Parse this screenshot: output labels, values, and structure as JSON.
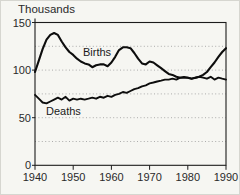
{
  "figure": {
    "y_axis_title": "Thousands",
    "births_label": "Births",
    "deaths_label": "Deaths"
  },
  "colors": {
    "line": "#0d0d0d",
    "frame": "#1c1c1c",
    "gridline": "#999999",
    "background": "#f6f6f2",
    "text": "#2a2a2a"
  },
  "chart_data": {
    "type": "line",
    "title": "",
    "xlabel": "",
    "ylabel": "Thousands",
    "xlim": [
      1940,
      1990
    ],
    "ylim": [
      0,
      150
    ],
    "x_ticks": [
      1940,
      1950,
      1960,
      1970,
      1980,
      1990
    ],
    "y_ticks": [
      0,
      50,
      100,
      150
    ],
    "gridlines": {
      "y_values": [
        25,
        50,
        75,
        100,
        125
      ],
      "style": "dotted"
    },
    "legend": "inline-annotations",
    "x": [
      1940,
      1941,
      1942,
      1943,
      1944,
      1945,
      1946,
      1947,
      1948,
      1949,
      1950,
      1951,
      1952,
      1953,
      1954,
      1955,
      1956,
      1957,
      1958,
      1959,
      1960,
      1961,
      1962,
      1963,
      1964,
      1965,
      1966,
      1967,
      1968,
      1969,
      1970,
      1971,
      1972,
      1973,
      1974,
      1975,
      1976,
      1977,
      1978,
      1979,
      1980,
      1981,
      1982,
      1983,
      1984,
      1985,
      1986,
      1987,
      1988,
      1989,
      1990
    ],
    "series": [
      {
        "name": "Births",
        "values": [
          98,
          110,
          122,
          132,
          137,
          139,
          137,
          130,
          124,
          119,
          116,
          112,
          109,
          107,
          106,
          103,
          105,
          106,
          106,
          104,
          108,
          114,
          121,
          124,
          124,
          123,
          118,
          112,
          107,
          106,
          109,
          108,
          105,
          102,
          99,
          96,
          95,
          93,
          92,
          92,
          92,
          91,
          92,
          93,
          95,
          98,
          103,
          108,
          114,
          119,
          123
        ]
      },
      {
        "name": "Deaths",
        "values": [
          74,
          70,
          66,
          65,
          67,
          69,
          71,
          69,
          72,
          68,
          70,
          69,
          70,
          69,
          70,
          71,
          70,
          72,
          71,
          73,
          72,
          74,
          75,
          77,
          76,
          78,
          80,
          81,
          83,
          84,
          86,
          87,
          88,
          89,
          90,
          90,
          91,
          90,
          92,
          93,
          92,
          91,
          92,
          93,
          92,
          91,
          93,
          90,
          92,
          91,
          90
        ]
      }
    ],
    "annotations": [
      {
        "text": "Births",
        "near_x": 1953,
        "near_y": 112
      },
      {
        "text": "Deaths",
        "near_x": 1943,
        "near_y": 57
      }
    ]
  }
}
